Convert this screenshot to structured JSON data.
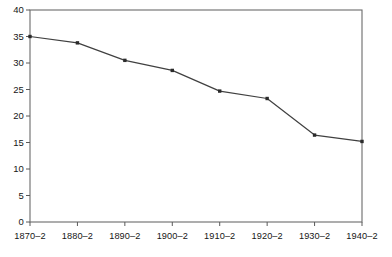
{
  "chart_data": {
    "type": "line",
    "title": "",
    "subtitle": "",
    "xlabel": "",
    "ylabel": "",
    "categories": [
      "1870–2",
      "1880–2",
      "1890–2",
      "1900–2",
      "1910–2",
      "1920–2",
      "1930–2",
      "1940–2"
    ],
    "values": [
      35.0,
      33.8,
      30.5,
      28.6,
      24.7,
      23.3,
      16.4,
      15.2
    ],
    "series": [
      {
        "name": "",
        "values": [
          35.0,
          33.8,
          30.5,
          28.6,
          24.7,
          23.3,
          16.4,
          15.2
        ]
      }
    ],
    "ylim": [
      0,
      40
    ],
    "yticks": [
      0,
      5,
      10,
      15,
      20,
      25,
      30,
      35,
      40
    ],
    "ytick_labels": [
      "0",
      "5",
      "10",
      "15",
      "20",
      "25",
      "30",
      "35",
      "40"
    ],
    "xtick_labels": [
      "1870–2",
      "1880–2",
      "1890–2",
      "1900–2",
      "1910–2",
      "1920–2",
      "1930–2",
      "1940–2"
    ],
    "grid": false,
    "legend": null,
    "legend_position": "none",
    "marker": "square",
    "annotations": [],
    "colors": {
      "line": "#404040",
      "marker": "#2b2b2b",
      "axis": "#5a5a5a",
      "frame": "#6b6b6b",
      "background": "#ffffff",
      "text": "#161616"
    }
  }
}
